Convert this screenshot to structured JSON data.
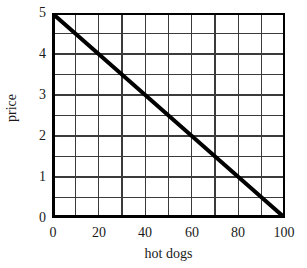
{
  "chart_data": {
    "type": "line",
    "title": "",
    "subtitle": "",
    "xlabel": "hot dogs",
    "ylabel": "price",
    "xlim": [
      0,
      100
    ],
    "ylim": [
      0,
      5
    ],
    "grid": true,
    "legend": null,
    "x_major_ticks": [
      0,
      20,
      40,
      60,
      80,
      100
    ],
    "x_minor_ticks": [
      10,
      30,
      50,
      70,
      90
    ],
    "x_gridlines": [
      0,
      10,
      20,
      30,
      40,
      50,
      60,
      70,
      80,
      90,
      100
    ],
    "y_major_ticks": [
      0,
      1,
      2,
      3,
      4,
      5
    ],
    "y_minor_ticks": [
      0.5,
      1.5,
      2.5,
      3.5,
      4.5
    ],
    "y_gridlines": [
      0,
      0.5,
      1,
      1.5,
      2,
      2.5,
      3,
      3.5,
      4,
      4.5,
      5
    ],
    "x_tick_labels": [
      "0",
      "20",
      "40",
      "60",
      "80",
      "100"
    ],
    "y_tick_labels": [
      "0",
      "1",
      "2",
      "3",
      "4",
      "5"
    ],
    "series": [
      {
        "name": "demand",
        "x": [
          0,
          10,
          20,
          30,
          40,
          50,
          60,
          70,
          80,
          90,
          100
        ],
        "values": [
          5,
          4.5,
          4,
          3.5,
          3,
          2.5,
          2,
          1.5,
          1,
          0.5,
          0
        ],
        "color": "#000000",
        "linewidth": 4
      }
    ],
    "colors": {
      "line": "#000000",
      "grid": "#3a3a3a",
      "axis": "#000000",
      "background": "#ffffff",
      "text": "#1a1a1a"
    }
  },
  "axes": {
    "y_labels": [
      "5",
      "4",
      "3",
      "2",
      "1",
      "0"
    ],
    "x_labels": [
      "0",
      "20",
      "40",
      "60",
      "80",
      "100"
    ],
    "x_title": "hot dogs",
    "y_title": "price"
  }
}
